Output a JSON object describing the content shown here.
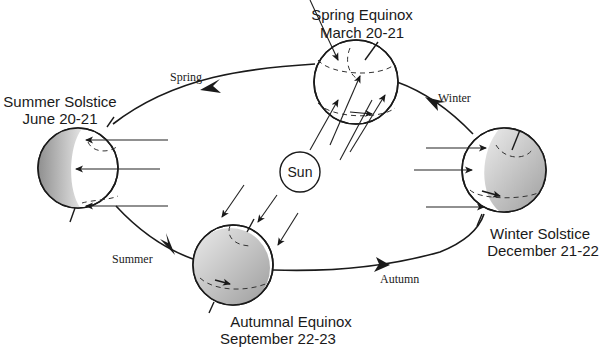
{
  "diagram": {
    "sun": {
      "label": "Sun"
    },
    "positions": [
      {
        "id": "spring-equinox",
        "name": "Spring Equinox",
        "date": "March 20-21"
      },
      {
        "id": "summer-solstice",
        "name": "Summer Solstice",
        "date": "June 20-21"
      },
      {
        "id": "autumnal-equinox",
        "name": "Autumnal Equinox",
        "date": "September 22-23"
      },
      {
        "id": "winter-solstice",
        "name": "Winter Solstice",
        "date": "December 21-22"
      }
    ],
    "seasons": [
      {
        "id": "spring",
        "label": "Spring"
      },
      {
        "id": "summer",
        "label": "Summer"
      },
      {
        "id": "autumn",
        "label": "Autumn"
      },
      {
        "id": "winter",
        "label": "Winter"
      }
    ],
    "colors": {
      "line": "#1a1a1a",
      "shadow_light": "#e8e8e8",
      "shadow_dark": "#9a9a9a",
      "background": "#ffffff"
    }
  }
}
